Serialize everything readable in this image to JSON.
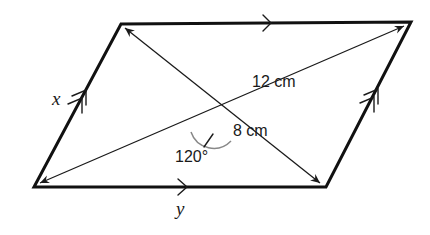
{
  "figure": {
    "type": "parallelogram",
    "vertices": {
      "top_left": [
        121,
        24
      ],
      "top_right": [
        411,
        22
      ],
      "bottom_left": [
        34,
        187
      ],
      "bottom_right": [
        326,
        187
      ]
    },
    "sides": {
      "left": {
        "label": "x",
        "parallel_marks": 2
      },
      "right": {
        "parallel_marks": 2
      },
      "top": {
        "parallel_marks": 1
      },
      "bottom": {
        "label": "y",
        "parallel_marks": 1
      }
    },
    "diagonals": [
      {
        "name": "long",
        "from": "bottom_left",
        "to": "top_right",
        "label": "12 cm",
        "double_arrow": true
      },
      {
        "name": "short",
        "from": "top_left",
        "to": "bottom_right",
        "label": "8 cm",
        "double_arrow": true
      }
    ],
    "angle": {
      "label": "120°",
      "between": "diagonals"
    }
  },
  "labels": {
    "side_left": "x",
    "side_bottom": "y",
    "long_diagonal": "12 cm",
    "short_diagonal": "8 cm",
    "angle": "120°"
  },
  "colors": {
    "stroke": "#111111",
    "arc": "#888888",
    "background": "#ffffff"
  }
}
